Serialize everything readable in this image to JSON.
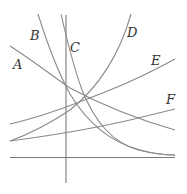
{
  "diagram": {
    "title": "",
    "curve_labels": [
      "A",
      "B",
      "C",
      "D",
      "E",
      "F"
    ],
    "labels": {
      "A": "A",
      "B": "B",
      "C": "C",
      "D": "D",
      "E": "E",
      "F": "F"
    },
    "stroke_color": "#8a8a8a",
    "axis_color": "#7a7a7a",
    "label_color": "#333333"
  }
}
